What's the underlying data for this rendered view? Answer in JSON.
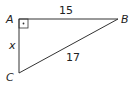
{
  "diagram": {
    "type": "right-triangle",
    "colors": {
      "stroke": "#333333",
      "text": "#222222",
      "background": "#ffffff"
    },
    "vertices": [
      {
        "id": "A",
        "label": "A",
        "x": 19,
        "y": 19
      },
      {
        "id": "B",
        "label": "B",
        "x": 118,
        "y": 19
      },
      {
        "id": "C",
        "label": "C",
        "x": 19,
        "y": 73
      }
    ],
    "sides": [
      {
        "from": "A",
        "to": "B",
        "label": "15"
      },
      {
        "from": "A",
        "to": "C",
        "label": "x"
      },
      {
        "from": "C",
        "to": "B",
        "label": "17"
      }
    ],
    "right_angle_at": "A",
    "right_angle_marker": "square-with-dot"
  }
}
